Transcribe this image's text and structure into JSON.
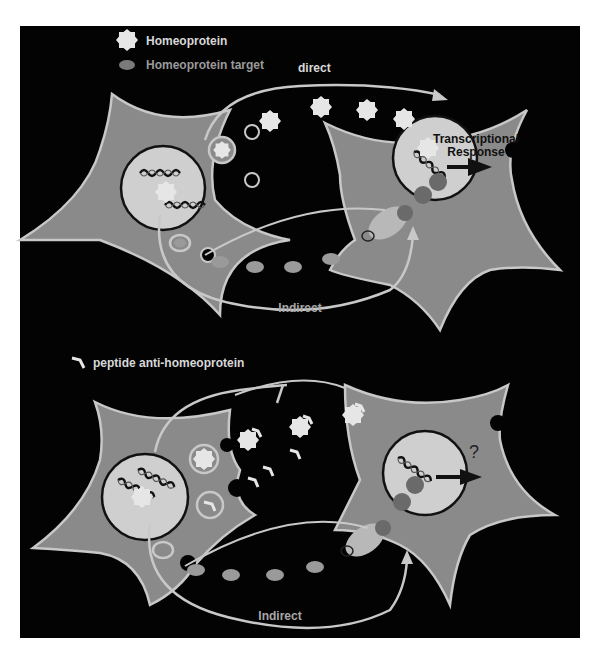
{
  "figure": {
    "background": "#030303",
    "cell_color": "#8a8a8a",
    "nucleus_color": "#cfcfcf",
    "outline_color": "#c8c8c8",
    "target_color": "#6a6a6a"
  },
  "legend_top": {
    "homeoprotein": "Homeoprotein",
    "homeoprotein_target": "Homeoprotein target"
  },
  "panel_top": {
    "direct_label": "direct",
    "indirect_label": "Indirect",
    "response_line1": "Transcriptional",
    "response_line2": "Response"
  },
  "legend_bottom": {
    "peptide": "peptide anti-homeoprotein"
  },
  "panel_bottom": {
    "indirect_label": "Indirect",
    "question": "?"
  }
}
